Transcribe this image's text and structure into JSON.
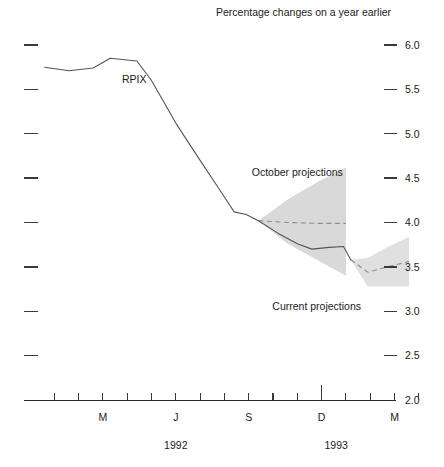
{
  "chart_data": {
    "type": "line",
    "title": "Percentage changes on a year earlier",
    "xlabel": "",
    "ylabel": "",
    "ylim": [
      2.0,
      6.0
    ],
    "ytick_values": [
      2.0,
      2.5,
      3.0,
      3.5,
      4.0,
      4.5,
      5.0,
      5.5,
      6.0
    ],
    "ytick_labels": [
      "2.0",
      "2.5",
      "3.0",
      "3.5",
      "4.0",
      "4.5",
      "5.0",
      "5.5",
      "6.0"
    ],
    "grid": false,
    "legend_position": "inline-annotations",
    "xlim": [
      0,
      16
    ],
    "xtick_months": [
      1,
      2,
      3,
      4,
      5,
      6,
      7,
      8,
      9,
      10,
      11,
      12,
      13,
      14,
      15,
      16
    ],
    "xtick_labeled": [
      {
        "month": 3,
        "label": "M"
      },
      {
        "month": 6,
        "label": "J"
      },
      {
        "month": 9,
        "label": "S"
      },
      {
        "month": 12,
        "label": "D"
      },
      {
        "month": 15,
        "label": "M"
      }
    ],
    "year_labels": [
      {
        "label": "1992",
        "center_month": 6.0
      },
      {
        "label": "1993",
        "center_month": 12.6
      }
    ],
    "series": [
      {
        "name": "RPIX",
        "style": "solid",
        "label": "RPIX",
        "color": "#555555",
        "points": [
          {
            "x": 0.6,
            "y": 5.75
          },
          {
            "x": 1.6,
            "y": 5.71
          },
          {
            "x": 2.6,
            "y": 5.74
          },
          {
            "x": 3.3,
            "y": 5.85
          },
          {
            "x": 4.4,
            "y": 5.82
          },
          {
            "x": 5.0,
            "y": 5.6
          },
          {
            "x": 6.0,
            "y": 5.12
          },
          {
            "x": 7.0,
            "y": 4.7
          },
          {
            "x": 7.9,
            "y": 4.33
          },
          {
            "x": 8.4,
            "y": 4.12
          },
          {
            "x": 8.9,
            "y": 4.09
          },
          {
            "x": 9.4,
            "y": 4.02
          },
          {
            "x": 10.2,
            "y": 3.88
          },
          {
            "x": 11.0,
            "y": 3.76
          },
          {
            "x": 11.6,
            "y": 3.7
          },
          {
            "x": 12.3,
            "y": 3.72
          },
          {
            "x": 12.9,
            "y": 3.73
          },
          {
            "x": 13.2,
            "y": 3.58
          }
        ]
      }
    ],
    "projection_fans": [
      {
        "name": "October projections",
        "label": "October projections",
        "label_x_month": 11.0,
        "label_y": 4.52,
        "fill": "#d9d9d9",
        "center_line_color": "#8d8d8d",
        "center_points": [
          {
            "x": 9.4,
            "y": 4.02
          },
          {
            "x": 10.6,
            "y": 4.0
          },
          {
            "x": 11.8,
            "y": 3.99
          },
          {
            "x": 13.0,
            "y": 3.99
          }
        ],
        "upper_points": [
          {
            "x": 9.4,
            "y": 4.02
          },
          {
            "x": 10.6,
            "y": 4.26
          },
          {
            "x": 11.8,
            "y": 4.45
          },
          {
            "x": 13.0,
            "y": 4.62
          }
        ],
        "lower_points": [
          {
            "x": 9.4,
            "y": 4.02
          },
          {
            "x": 10.6,
            "y": 3.76
          },
          {
            "x": 11.8,
            "y": 3.58
          },
          {
            "x": 13.0,
            "y": 3.4
          }
        ]
      },
      {
        "name": "Current projections",
        "label": "Current projections",
        "label_x_month": 11.8,
        "label_y": 3.02,
        "fill": "#e0e0e0",
        "center_line_color": "#8d8d8d",
        "center_points": [
          {
            "x": 13.2,
            "y": 3.58
          },
          {
            "x": 13.9,
            "y": 3.44
          },
          {
            "x": 14.7,
            "y": 3.5
          },
          {
            "x": 15.6,
            "y": 3.56
          }
        ],
        "upper_points": [
          {
            "x": 13.2,
            "y": 3.58
          },
          {
            "x": 13.9,
            "y": 3.6
          },
          {
            "x": 14.7,
            "y": 3.72
          },
          {
            "x": 15.6,
            "y": 3.84
          }
        ],
        "lower_points": [
          {
            "x": 13.2,
            "y": 3.58
          },
          {
            "x": 13.9,
            "y": 3.28
          },
          {
            "x": 14.7,
            "y": 3.28
          },
          {
            "x": 15.6,
            "y": 3.28
          }
        ]
      }
    ]
  },
  "chart": {
    "title": "Percentage changes on a year earlier",
    "series_label_rpix": "RPIX",
    "annotation_october": "October projections",
    "annotation_current": "Current projections",
    "year_1992": "1992",
    "year_1993": "1993",
    "ylabels": {
      "v60": "6.0",
      "v55": "5.5",
      "v50": "5.0",
      "v45": "4.5",
      "v40": "4.0",
      "v35": "3.5",
      "v30": "3.0",
      "v25": "2.5",
      "v20": "2.0"
    },
    "xlabels": {
      "m1": "M",
      "j1": "J",
      "s1": "S",
      "d1": "D",
      "m2": "M"
    },
    "colors": {
      "line": "#555555",
      "fan_october": "#d9d9d9",
      "fan_current": "#e0e0e0",
      "dashed": "#8d8d8d",
      "axis": "#2b2b2b",
      "text": "#1a1a1a"
    }
  }
}
